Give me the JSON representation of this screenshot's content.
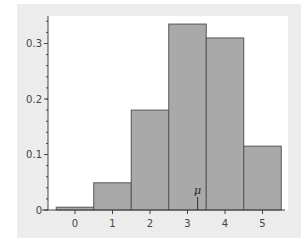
{
  "chart_data": {
    "type": "bar",
    "title": "",
    "xlabel": "",
    "ylabel": "",
    "categories": [
      "0",
      "1",
      "2",
      "3",
      "4",
      "5"
    ],
    "values": [
      0.005,
      0.049,
      0.18,
      0.335,
      0.31,
      0.115
    ],
    "ylim": [
      0,
      0.35
    ],
    "yticks": [
      "0",
      "0.1",
      "0.2",
      "0.3"
    ],
    "xticks": [
      "0",
      "1",
      "2",
      "3",
      "4",
      "5"
    ],
    "grid": false,
    "legend": null,
    "annotations": [
      {
        "label": "μ",
        "x": 3.27
      }
    ],
    "bar_color": "#a9a9a9",
    "bar_edge_color": "#555555"
  }
}
